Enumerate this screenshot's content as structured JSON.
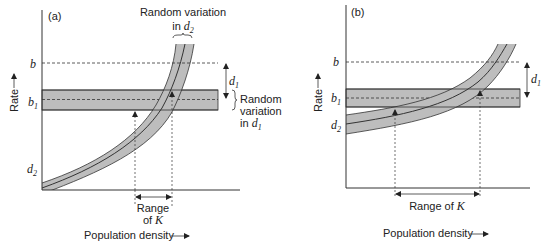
{
  "panels": [
    {
      "id": "a",
      "label": "(a)",
      "y_axis_label": "Rate",
      "x_axis_label": "Population density",
      "line_b_label": "b",
      "line_b1_label_main": "b",
      "line_b1_label_sub": "1",
      "curve_label_main": "d",
      "curve_label_sub": "2",
      "d1_label_main": "d",
      "d1_label_sub": "1",
      "random_d2_line1": "Random variation",
      "random_d2_line2_prefix": "in ",
      "random_d2_main": "d",
      "random_d2_sub": "2",
      "random_d1_line1": "Random",
      "random_d1_line2": "variation",
      "random_d1_line3_prefix": "in ",
      "random_d1_main": "d",
      "random_d1_sub": "1",
      "range_line1": "Range",
      "range_line2_prefix": "of ",
      "range_k": "K"
    },
    {
      "id": "b",
      "label": "(b)",
      "y_axis_label": "Rate",
      "x_axis_label": "Population density",
      "line_b_label": "b",
      "line_b1_label_main": "b",
      "line_b1_label_sub": "1",
      "curve_label_main": "d",
      "curve_label_sub": "2",
      "d1_label_main": "d",
      "d1_label_sub": "1",
      "range_prefix": "Range of ",
      "range_k": "K"
    }
  ],
  "colors": {
    "band_fill": "#bdbdbd",
    "line": "#333333",
    "text": "#222222"
  }
}
